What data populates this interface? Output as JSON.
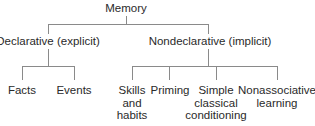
{
  "diagram": {
    "title": "Memory",
    "root": {
      "label": "Memory"
    },
    "branches": [
      {
        "label": "Declarative (explicit)",
        "children": [
          {
            "label": "Facts"
          },
          {
            "label": "Events"
          }
        ]
      },
      {
        "label": "Nondeclarative (implicit)",
        "children": [
          {
            "label": "Skills and habits",
            "lines": [
              "Skills",
              "and",
              "habits"
            ]
          },
          {
            "label": "Priming",
            "lines": [
              "Priming"
            ]
          },
          {
            "label": "Simple classical conditioning",
            "lines": [
              "Simple",
              "classical",
              "conditioning"
            ]
          },
          {
            "label": "Nonassociative learning",
            "lines": [
              "Nonassociative",
              "learning"
            ]
          }
        ]
      }
    ]
  },
  "colors": {
    "line": "#8a8a8a",
    "text": "#2a2a2a",
    "background": "#ffffff"
  }
}
